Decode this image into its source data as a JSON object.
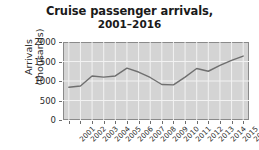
{
  "chart_data": {
    "type": "line",
    "title": "Cruise passenger arrivals,",
    "subtitle": "2001–2016",
    "xlabel": "",
    "ylabel_line1": "Arrivals",
    "ylabel_line2": "(thousands)",
    "categories": [
      "2001",
      "2002",
      "2003",
      "2004",
      "2005",
      "2006",
      "2007",
      "2008",
      "2009",
      "2010",
      "2011",
      "2012",
      "2013",
      "2014",
      "2015",
      "2016"
    ],
    "values": [
      840,
      870,
      1130,
      1100,
      1130,
      1330,
      1230,
      1090,
      910,
      900,
      1100,
      1320,
      1250,
      1400,
      1530,
      1640
    ],
    "yticks": [
      "0",
      "500",
      "1000",
      "1500",
      "2000"
    ],
    "ylim": [
      0,
      2000
    ],
    "grid": true,
    "legend": "none",
    "series_color": "#6f6f6f",
    "plot_background": "#d4d4d4",
    "gridline_color": "#f2f2f2",
    "axis_color": "#8a8a8a",
    "text_color": "#1a1a1a"
  }
}
